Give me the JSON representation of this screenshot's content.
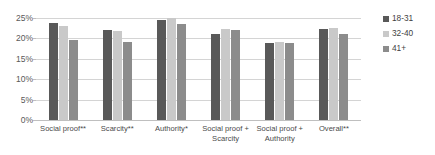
{
  "chart_data": {
    "type": "bar",
    "title": "",
    "subtitle": "",
    "xlabel": "",
    "ylabel": "",
    "ylim": [
      0,
      25
    ],
    "ytick_labels": [
      "0%",
      "5%",
      "10%",
      "15%",
      "20%",
      "25%"
    ],
    "ytick_values": [
      0,
      5,
      10,
      15,
      20,
      25
    ],
    "grid": true,
    "legend_position": "right",
    "categories": [
      "Social proof**",
      "Scarcity**",
      "Authority*",
      "Social proof + Scarcity",
      "Social proof + Authority",
      "Overall**"
    ],
    "series": [
      {
        "name": "18-31",
        "color": "#595959",
        "values": [
          23.8,
          22.0,
          24.6,
          21.0,
          18.8,
          22.3
        ]
      },
      {
        "name": "32-40",
        "color": "#c9c9c9",
        "values": [
          23.0,
          21.8,
          25.0,
          22.2,
          19.0,
          22.5
        ]
      },
      {
        "name": "41+",
        "color": "#8c8c8c",
        "values": [
          19.7,
          19.0,
          23.5,
          22.0,
          18.9,
          21.0
        ]
      }
    ]
  },
  "legend": {
    "items": [
      {
        "label": "18-31",
        "color": "#595959"
      },
      {
        "label": "32-40",
        "color": "#c9c9c9"
      },
      {
        "label": "41+",
        "color": "#8c8c8c"
      }
    ]
  },
  "colors": {
    "gridline": "#d4d4d4",
    "axis": "#bfbfbf",
    "tick_text": "#595959",
    "category_text": "#4a4a4a",
    "background": "#ffffff"
  }
}
